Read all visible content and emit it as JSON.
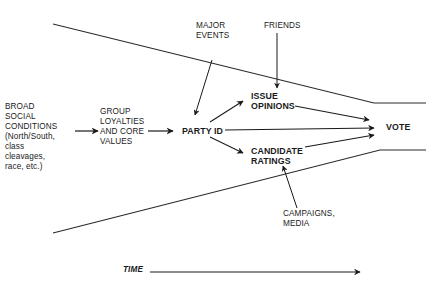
{
  "diagram": {
    "nodes": {
      "broad_social": {
        "label": "BROAD\nSOCIAL\nCONDITIONS\n(North/South,\nclass\ncleavages,\nrace, etc.)"
      },
      "group_loyalties": {
        "label": "GROUP\nLOYALTIES\nAND CORE\nVALUES"
      },
      "party_id": {
        "label": "PARTY ID"
      },
      "issue_opinions": {
        "label": "ISSUE\nOPINIONS"
      },
      "candidate_ratings": {
        "label": "CANDIDATE\nRATINGS"
      },
      "vote": {
        "label": "VOTE"
      },
      "major_events": {
        "label": "MAJOR\nEVENTS"
      },
      "friends": {
        "label": "FRIENDS"
      },
      "campaigns_media": {
        "label": "CAMPAIGNS,\nMEDIA"
      }
    },
    "edges": [
      {
        "from": "broad_social",
        "to": "group_loyalties"
      },
      {
        "from": "group_loyalties",
        "to": "party_id"
      },
      {
        "from": "major_events",
        "to": "party_id"
      },
      {
        "from": "party_id",
        "to": "issue_opinions"
      },
      {
        "from": "party_id",
        "to": "vote"
      },
      {
        "from": "party_id",
        "to": "candidate_ratings"
      },
      {
        "from": "friends",
        "to": "issue_opinions"
      },
      {
        "from": "campaigns_media",
        "to": "candidate_ratings"
      },
      {
        "from": "issue_opinions",
        "to": "vote"
      },
      {
        "from": "candidate_ratings",
        "to": "vote"
      }
    ],
    "time_axis": {
      "label": "TIME"
    },
    "colors": {
      "line": "#2a2a2a",
      "text": "#1a1a1a",
      "background": "#ffffff"
    }
  }
}
